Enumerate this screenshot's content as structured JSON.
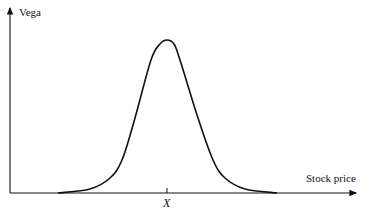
{
  "chart_data": {
    "type": "line",
    "title": "",
    "xlabel": "Stock price",
    "ylabel": "Vega",
    "x_ticks": [
      {
        "label": "X",
        "position": "center (strike price)"
      }
    ],
    "grid": false,
    "legend": null,
    "series": [
      {
        "name": "Vega",
        "x": [
          58,
          90,
          110,
          122,
          135,
          151,
          160,
          167,
          174,
          180,
          198,
          213,
          225,
          245,
          277
        ],
        "y": [
          193,
          189,
          178,
          160,
          118,
          60,
          44,
          40,
          44,
          60,
          118,
          160,
          178,
          189,
          193
        ],
        "units": "pixel coordinates (peak at x=167, baseline y=193)"
      }
    ]
  },
  "labels": {
    "y_axis": "Vega",
    "x_axis": "Stock price",
    "tick": "X"
  }
}
